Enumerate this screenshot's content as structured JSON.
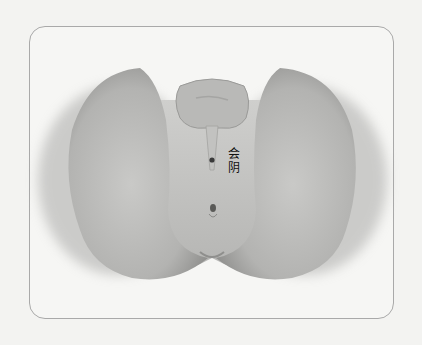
{
  "figure": {
    "type": "anatomical-illustration",
    "colors": {
      "background": "#f3f3f1",
      "frame_border": "#a9a9a9",
      "tissue_light": "#c8c8c6",
      "tissue_dark": "#8e8e8c",
      "point_marker": "#3a3a3a"
    },
    "labels": [
      {
        "id": "huiyin",
        "text": "会\n阴",
        "line1": "会",
        "line2": "阴"
      }
    ],
    "markers": [
      {
        "name": "huiyin-point",
        "x": 212,
        "y": 160
      },
      {
        "name": "anus-opening",
        "x": 212,
        "y": 210
      }
    ]
  }
}
